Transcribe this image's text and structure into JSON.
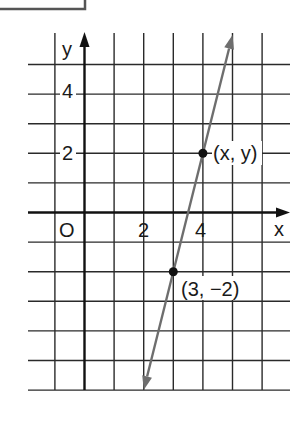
{
  "figure": {
    "type": "coordinate-grid-line-plot",
    "axis_labels": {
      "x": "x",
      "y": "y",
      "origin": "O"
    },
    "x_tick_labels": [
      "2",
      "4"
    ],
    "y_tick_labels": [
      "4",
      "2"
    ],
    "grid": {
      "x_min": -1,
      "x_max": 7,
      "y_min": -6,
      "y_max": 6,
      "step": 1
    },
    "line": {
      "slope": 4,
      "intercept": -14,
      "from": [
        2,
        -6
      ],
      "to": [
        5,
        6
      ],
      "arrows": "both",
      "color": "#6e6e6e"
    },
    "points": [
      {
        "x": 4,
        "y": 2,
        "label": "(x, y)"
      },
      {
        "x": 3,
        "y": -2,
        "label": "(3, −2)"
      }
    ]
  }
}
